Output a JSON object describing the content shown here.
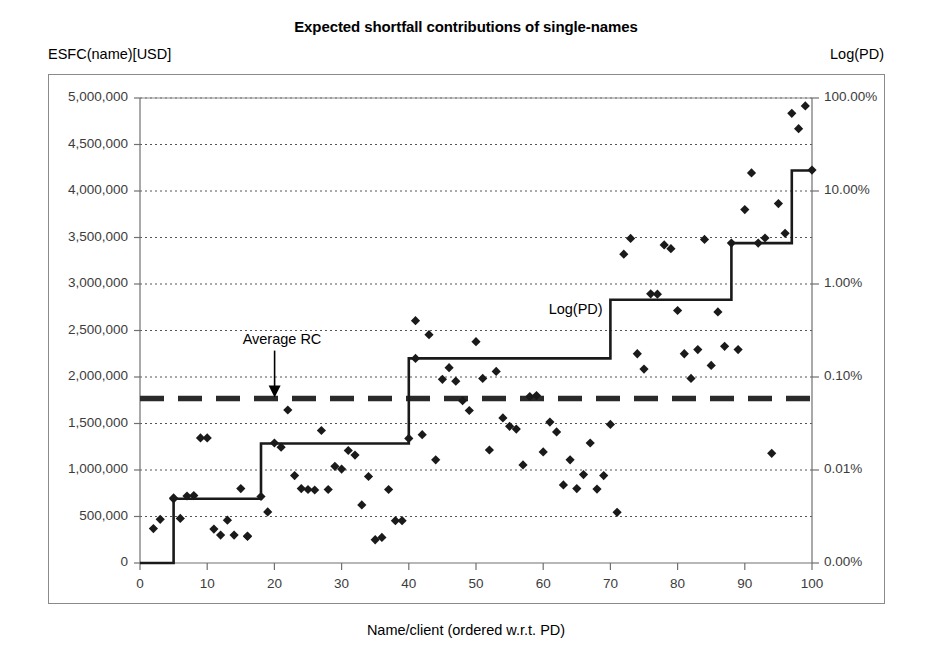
{
  "chart_data": {
    "type": "scatter",
    "title": "Expected shortfall contributions of single-names",
    "xlabel": "Name/client (ordered w.r.t. PD)",
    "ylabel": "ESFC(name)[USD]",
    "y2label": "Log(PD)",
    "xlim": [
      0,
      100
    ],
    "ylim": [
      0,
      5000000
    ],
    "xticks": [
      0,
      10,
      20,
      30,
      40,
      50,
      60,
      70,
      80,
      90,
      100
    ],
    "xticklabels": [
      "0",
      "10",
      "20",
      "30",
      "40",
      "50",
      "60",
      "70",
      "80",
      "90",
      "100"
    ],
    "yticks": [
      0,
      500000,
      1000000,
      1500000,
      2000000,
      2500000,
      3000000,
      3500000,
      4000000,
      4500000,
      5000000
    ],
    "yticklabels": [
      "0",
      "500,000",
      "1,000,000",
      "1,500,000",
      "2,000,000",
      "2,500,000",
      "3,000,000",
      "3,500,000",
      "4,000,000",
      "4,500,000",
      "5,000,000"
    ],
    "y2ticks": [
      0,
      1000000,
      2000000,
      3000000,
      4000000,
      5000000
    ],
    "y2ticklabels": [
      "0.00%",
      "0.01%",
      "0.10%",
      "1.00%",
      "10.00%",
      "100.00%"
    ],
    "y2scale": "log",
    "grid": true,
    "grid_style": "dotted",
    "legend": "none",
    "annotations": [
      {
        "name": "average-rc",
        "text": "Average RC",
        "x": 12,
        "y": 2370000,
        "arrow_to_y": 1770000
      },
      {
        "name": "log-pd",
        "text": "Log(PD)",
        "x": 62,
        "y": 2700000
      }
    ],
    "series": [
      {
        "name": "ESFC scatter",
        "type": "scatter",
        "marker": "diamond",
        "color": "#1a1a1a",
        "points": [
          [
            2,
            370000
          ],
          [
            3,
            470000
          ],
          [
            5,
            700000
          ],
          [
            5,
            690000
          ],
          [
            6,
            480000
          ],
          [
            7,
            720000
          ],
          [
            8,
            725000
          ],
          [
            9,
            1345000
          ],
          [
            10,
            1345000
          ],
          [
            11,
            365000
          ],
          [
            12,
            300000
          ],
          [
            13,
            460000
          ],
          [
            14,
            300000
          ],
          [
            15,
            800000
          ],
          [
            16,
            290000
          ],
          [
            16,
            285000
          ],
          [
            18,
            715000
          ],
          [
            19,
            550000
          ],
          [
            20,
            1290000
          ],
          [
            21,
            1245000
          ],
          [
            22,
            1645000
          ],
          [
            23,
            940000
          ],
          [
            24,
            800000
          ],
          [
            25,
            790000
          ],
          [
            26,
            785000
          ],
          [
            27,
            1425000
          ],
          [
            28,
            790000
          ],
          [
            29,
            1040000
          ],
          [
            30,
            1010000
          ],
          [
            31,
            1210000
          ],
          [
            32,
            1160000
          ],
          [
            33,
            625000
          ],
          [
            34,
            930000
          ],
          [
            35,
            250000
          ],
          [
            36,
            275000
          ],
          [
            37,
            790000
          ],
          [
            38,
            455000
          ],
          [
            39,
            455000
          ],
          [
            40,
            1340000
          ],
          [
            41,
            2200000
          ],
          [
            41,
            2605000
          ],
          [
            42,
            1380000
          ],
          [
            43,
            2455000
          ],
          [
            44,
            1110000
          ],
          [
            45,
            1975000
          ],
          [
            46,
            2100000
          ],
          [
            47,
            1955000
          ],
          [
            48,
            1745000
          ],
          [
            49,
            1640000
          ],
          [
            50,
            2380000
          ],
          [
            51,
            1985000
          ],
          [
            52,
            1215000
          ],
          [
            53,
            2060000
          ],
          [
            54,
            1560000
          ],
          [
            55,
            1470000
          ],
          [
            56,
            1440000
          ],
          [
            57,
            1055000
          ],
          [
            58,
            1790000
          ],
          [
            59,
            1800000
          ],
          [
            60,
            1195000
          ],
          [
            61,
            1515000
          ],
          [
            62,
            1410000
          ],
          [
            63,
            840000
          ],
          [
            64,
            1110000
          ],
          [
            65,
            800000
          ],
          [
            66,
            950000
          ],
          [
            67,
            1290000
          ],
          [
            68,
            795000
          ],
          [
            69,
            940000
          ],
          [
            70,
            1490000
          ],
          [
            71,
            545000
          ],
          [
            72,
            3320000
          ],
          [
            73,
            3490000
          ],
          [
            74,
            2250000
          ],
          [
            75,
            2085000
          ],
          [
            76,
            2895000
          ],
          [
            77,
            2890000
          ],
          [
            78,
            3420000
          ],
          [
            79,
            3380000
          ],
          [
            80,
            2715000
          ],
          [
            81,
            2250000
          ],
          [
            82,
            1985000
          ],
          [
            83,
            2295000
          ],
          [
            84,
            3480000
          ],
          [
            85,
            2125000
          ],
          [
            86,
            2700000
          ],
          [
            87,
            2330000
          ],
          [
            88,
            3440000
          ],
          [
            89,
            2295000
          ],
          [
            90,
            3800000
          ],
          [
            91,
            4195000
          ],
          [
            92,
            3440000
          ],
          [
            93,
            3495000
          ],
          [
            94,
            1180000
          ],
          [
            95,
            3865000
          ],
          [
            96,
            3545000
          ],
          [
            97,
            4835000
          ],
          [
            98,
            4670000
          ],
          [
            99,
            4915000
          ],
          [
            100,
            4225000
          ]
        ]
      },
      {
        "name": "Log(PD) step",
        "type": "step",
        "color": "#1a1a1a",
        "points": [
          [
            0,
            0
          ],
          [
            5,
            0
          ],
          [
            5,
            690000
          ],
          [
            18,
            690000
          ],
          [
            18,
            1285000
          ],
          [
            40,
            1285000
          ],
          [
            40,
            2200000
          ],
          [
            70,
            2200000
          ],
          [
            70,
            2830000
          ],
          [
            88,
            2830000
          ],
          [
            88,
            3440000
          ],
          [
            97,
            3440000
          ],
          [
            97,
            4220000
          ],
          [
            100,
            4220000
          ]
        ]
      },
      {
        "name": "Average RC",
        "type": "hline",
        "value": 1770000,
        "style": "dashed",
        "color": "#2a2a2a"
      }
    ]
  }
}
